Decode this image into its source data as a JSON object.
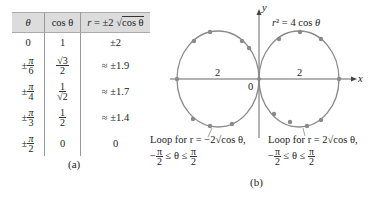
{
  "table": {
    "headers": [
      "θ",
      "cos θ",
      "r = ±2 √cos θ"
    ],
    "header_parts": {
      "r_lhs": "r = ±2 ",
      "sqrt_arg": "cos θ"
    },
    "rows": [
      {
        "theta": "0",
        "theta_pm": "",
        "theta_num": "",
        "theta_den": "",
        "cos": "1",
        "cos_num": "",
        "cos_den": "",
        "r": "±2"
      },
      {
        "theta": "",
        "theta_pm": "±",
        "theta_num": "π",
        "theta_den": "6",
        "cos": "",
        "cos_num": "√3",
        "cos_den": "2",
        "r": "≈  ±1.9"
      },
      {
        "theta": "",
        "theta_pm": "±",
        "theta_num": "π",
        "theta_den": "4",
        "cos": "",
        "cos_num": "1",
        "cos_den": "√2",
        "r": "≈  ±1.7"
      },
      {
        "theta": "",
        "theta_pm": "±",
        "theta_num": "π",
        "theta_den": "3",
        "cos": "",
        "cos_num": "1",
        "cos_den": "2",
        "r": "≈  ±1.4"
      },
      {
        "theta": "",
        "theta_pm": "±",
        "theta_num": "π",
        "theta_den": "2",
        "cos": "0",
        "cos_num": "",
        "cos_den": "",
        "r": "0"
      }
    ],
    "caption": "(a)"
  },
  "graph": {
    "equation": "r² = 4 cos θ",
    "y_axis_label": "y",
    "x_axis_label": "x",
    "origin_label": "0",
    "left_radius_label": "2",
    "right_radius_label": "2",
    "left_loop": {
      "line1": "Loop for r = −2√cos θ,",
      "line2_pre": "−",
      "line2_mid": " ≤ θ ≤ ",
      "frac_num": "π",
      "frac_den": "2"
    },
    "right_loop": {
      "line1": "Loop for r = 2√cos θ,",
      "line2_pre": "−",
      "line2_mid": " ≤ θ ≤ ",
      "frac_num": "π",
      "frac_den": "2"
    },
    "caption": "(b)",
    "colors": {
      "curve": "#8a8a8a",
      "dots": "#8a8a8a",
      "axes": "#666666"
    }
  }
}
